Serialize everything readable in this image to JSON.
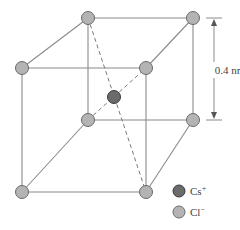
{
  "colors": {
    "background": "#ffffff",
    "edge": "#8a8a8a",
    "cs_fill": "#6b6b6b",
    "cs_stroke": "#3a3a3a",
    "cl_fill": "#b4b4b4",
    "cl_stroke": "#6a6a6a"
  },
  "atoms": {
    "cl_corners": [
      {
        "name": "top-back-left",
        "x": 88,
        "y": 18
      },
      {
        "name": "top-back-right",
        "x": 193,
        "y": 18
      },
      {
        "name": "top-front-left",
        "x": 22,
        "y": 68
      },
      {
        "name": "top-front-right",
        "x": 146,
        "y": 68
      },
      {
        "name": "bottom-back-left",
        "x": 88,
        "y": 120
      },
      {
        "name": "bottom-back-right",
        "x": 193,
        "y": 120
      },
      {
        "name": "bottom-front-left",
        "x": 22,
        "y": 192
      },
      {
        "name": "bottom-front-right",
        "x": 146,
        "y": 192
      }
    ],
    "cs_center": {
      "x": 114,
      "y": 97
    }
  },
  "dimension": {
    "label": "0.4 nm",
    "from_y": 18,
    "to_y": 120,
    "x": 214
  },
  "legend": {
    "items": [
      {
        "ion": "Cs",
        "charge": "+",
        "type": "cs"
      },
      {
        "ion": "Cl",
        "charge": "−",
        "type": "cl"
      }
    ]
  }
}
